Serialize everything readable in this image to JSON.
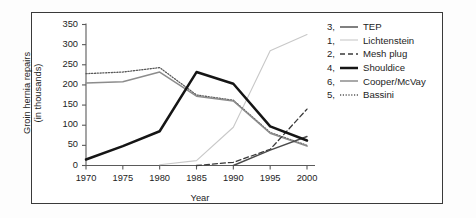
{
  "chart_data": {
    "type": "line",
    "title": "",
    "xlabel": "Year",
    "ylabel": "Groin hernia repairs (in thousands)",
    "xlim": [
      1968,
      2001
    ],
    "ylim": [
      0,
      350
    ],
    "xticks": [
      "1970",
      "1975",
      "1980",
      "1985",
      "1990",
      "1995",
      "2000"
    ],
    "yticks": [
      "0",
      "50",
      "100",
      "150",
      "200",
      "250",
      "300",
      "350"
    ],
    "grid": false,
    "legend_position": "right",
    "x": [
      1970,
      1975,
      1980,
      1985,
      1990,
      1995,
      2000
    ],
    "series": [
      {
        "name": "TEP",
        "legend_number": "3",
        "style": "solid-dark",
        "color": "#4a4a4a",
        "values": [
          null,
          null,
          null,
          null,
          0,
          38,
          72
        ]
      },
      {
        "name": "Lichtenstein",
        "legend_number": "1",
        "style": "solid-light",
        "color": "#c8c8c8",
        "values": [
          null,
          null,
          2,
          12,
          95,
          285,
          325
        ]
      },
      {
        "name": "Mesh plug",
        "legend_number": "2",
        "style": "dash-dot",
        "color": "#3a3a3a",
        "values": [
          null,
          null,
          null,
          0,
          8,
          40,
          140
        ]
      },
      {
        "name": "Shouldice",
        "legend_number": "4",
        "style": "thick-black",
        "color": "#151515",
        "values": [
          15,
          48,
          85,
          232,
          203,
          97,
          62
        ]
      },
      {
        "name": "Cooper/McVay",
        "legend_number": "6",
        "style": "solid-gray",
        "color": "#8c8c8c",
        "values": [
          205,
          208,
          232,
          172,
          160,
          80,
          48
        ]
      },
      {
        "name": "Bassini",
        "legend_number": "5",
        "style": "dotted",
        "color": "#5a5a5a",
        "values": [
          228,
          232,
          243,
          175,
          162,
          82,
          50
        ]
      }
    ]
  },
  "axes": {
    "y_title_line1": "Groin hernia repairs",
    "y_title_line2": "(in thousands)",
    "x_title": "Year"
  },
  "legend": {
    "entries": [
      {
        "num": "3,",
        "label": "TEP"
      },
      {
        "num": "1,",
        "label": "Lichtenstein"
      },
      {
        "num": "2,",
        "label": "Mesh plug"
      },
      {
        "num": "4,",
        "label": "Shouldice"
      },
      {
        "num": "6,",
        "label": "Cooper/McVay"
      },
      {
        "num": "5,",
        "label": "Bassini"
      }
    ]
  },
  "ytick_labels": [
    "350",
    "300",
    "250",
    "200",
    "150",
    "100",
    "50",
    "0"
  ],
  "xtick_labels": [
    "1970",
    "1975",
    "1980",
    "1985",
    "1990",
    "1995",
    "2000"
  ],
  "colors": {
    "frame": "#3a3a3a",
    "axis": "#5a5a5a",
    "text": "#1d1d1d"
  }
}
